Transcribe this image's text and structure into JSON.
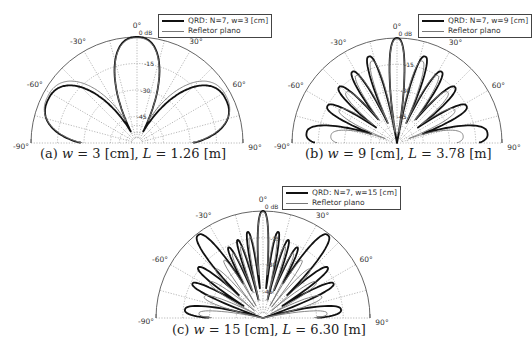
{
  "figure": {
    "background": "#ffffff",
    "line_colors": {
      "qrd": "#111111",
      "flat": "#7a7a7a",
      "grid": "#8a8a8a"
    }
  },
  "chart_data": [
    {
      "id": "a",
      "type": "polar",
      "caption": {
        "prefix": "(a) ",
        "var1": "w",
        "eq1": " = 3 [cm], ",
        "var2": "L",
        "eq2": " = 1.26 [m]"
      },
      "legend": [
        {
          "label": "QRD: N=7, w=3 [cm]",
          "style": "thick"
        },
        {
          "label": "Refletor plano",
          "style": "thin"
        }
      ],
      "angle_ticks": [
        "-90°",
        "-60°",
        "-30°",
        "0°",
        "30°",
        "60°",
        "90°"
      ],
      "angle_range": [
        -90,
        90
      ],
      "radial_ticks": [
        "0 dB",
        "-15",
        "-30",
        "-45"
      ],
      "radial_range_db": [
        -60,
        0
      ],
      "grid": true,
      "geometry": {
        "left": 31,
        "top": 0,
        "cx": 106,
        "cy": 143,
        "r": 106
      },
      "legend_pos": {
        "left": 158,
        "top": 14
      },
      "caption_pos": {
        "left": 40,
        "top": 146
      },
      "series": [
        {
          "name": "QRD: N=7, w=3 [cm]",
          "key": "qrd",
          "width": 1.8,
          "lobes": [
            {
              "center": 0,
              "peak": 0,
              "hw": 30
            },
            {
              "center": -64,
              "peak": -4,
              "hw": 38
            },
            {
              "center": 64,
              "peak": -4,
              "hw": 38
            }
          ]
        },
        {
          "name": "Refletor plano",
          "key": "flat",
          "width": 0.9,
          "lobes": [
            {
              "center": 0,
              "peak": -0.5,
              "hw": 30
            },
            {
              "center": -62,
              "peak": -3,
              "hw": 40
            },
            {
              "center": 62,
              "peak": -3,
              "hw": 40
            }
          ]
        }
      ]
    },
    {
      "id": "b",
      "type": "polar",
      "caption": {
        "prefix": "(b) ",
        "var1": "w",
        "eq1": " = 9 [cm], ",
        "var2": "L",
        "eq2": " = 3.78 [m]"
      },
      "legend": [
        {
          "label": "QRD: N=7, w=9 [cm]",
          "style": "thick"
        },
        {
          "label": "Refletor plano",
          "style": "thin"
        }
      ],
      "angle_ticks": [
        "-90°",
        "-60°",
        "-30°",
        "0°",
        "30°",
        "60°",
        "90°"
      ],
      "angle_range": [
        -90,
        90
      ],
      "radial_ticks": [
        "0 dB",
        "-15",
        "-30",
        "-45"
      ],
      "radial_range_db": [
        -60,
        0
      ],
      "grid": true,
      "geometry": {
        "left": 292,
        "top": 0,
        "cx": 105,
        "cy": 143,
        "r": 105
      },
      "legend_pos": {
        "left": 418,
        "top": 14
      },
      "caption_pos": {
        "left": 305,
        "top": 146
      },
      "series": [
        {
          "name": "QRD: N=7, w=9 [cm]",
          "key": "qrd",
          "width": 1.8,
          "lobes": [
            {
              "center": 0,
              "peak": 0,
              "hw": 10
            },
            {
              "center": -18,
              "peak": -8,
              "hw": 8
            },
            {
              "center": 18,
              "peak": -8,
              "hw": 8
            },
            {
              "center": -32,
              "peak": -12,
              "hw": 8
            },
            {
              "center": 32,
              "peak": -12,
              "hw": 8
            },
            {
              "center": -46,
              "peak": -14,
              "hw": 9
            },
            {
              "center": 46,
              "peak": -14,
              "hw": 9
            },
            {
              "center": -62,
              "peak": -15,
              "hw": 10
            },
            {
              "center": 62,
              "peak": -15,
              "hw": 10
            },
            {
              "center": -84,
              "peak": -8,
              "hw": 16
            },
            {
              "center": 84,
              "peak": -8,
              "hw": 16
            }
          ]
        },
        {
          "name": "Refletor plano",
          "key": "flat",
          "width": 0.9,
          "lobes": [
            {
              "center": 0,
              "peak": -0.5,
              "hw": 10
            },
            {
              "center": -17,
              "peak": -11,
              "hw": 8
            },
            {
              "center": 17,
              "peak": -11,
              "hw": 8
            },
            {
              "center": -31,
              "peak": -15,
              "hw": 8
            },
            {
              "center": 31,
              "peak": -15,
              "hw": 8
            },
            {
              "center": -45,
              "peak": -19,
              "hw": 9
            },
            {
              "center": 45,
              "peak": -19,
              "hw": 9
            },
            {
              "center": -60,
              "peak": -22,
              "hw": 10
            },
            {
              "center": 60,
              "peak": -22,
              "hw": 10
            },
            {
              "center": -84,
              "peak": -22,
              "hw": 16
            },
            {
              "center": 84,
              "peak": -22,
              "hw": 16
            }
          ]
        }
      ]
    },
    {
      "id": "c",
      "type": "polar",
      "caption": {
        "prefix": "(c) ",
        "var1": "w",
        "eq1": " = 15 [cm], ",
        "var2": "L",
        "eq2": " = 6.30 [m]"
      },
      "legend": [
        {
          "label": "QRD: N=7, w=15 [cm]",
          "style": "thick"
        },
        {
          "label": "Refletor plano",
          "style": "thin"
        }
      ],
      "angle_ticks": [
        "-90°",
        "-60°",
        "-30°",
        "0°",
        "30°",
        "60°",
        "90°"
      ],
      "angle_range": [
        -90,
        90
      ],
      "radial_ticks": [
        "0 dB",
        "-15",
        "-30",
        "-45"
      ],
      "radial_range_db": [
        -60,
        0
      ],
      "grid": true,
      "geometry": {
        "left": 156,
        "top": 176,
        "cx": 107,
        "cy": 142,
        "r": 107
      },
      "legend_pos": {
        "left": 282,
        "top": 186
      },
      "caption_pos": {
        "left": 172,
        "top": 322
      },
      "series": [
        {
          "name": "QRD: N=7, w=15 [cm]",
          "key": "qrd",
          "width": 1.8,
          "lobes": [
            {
              "center": 0,
              "peak": 0,
              "hw": 7
            },
            {
              "center": -10,
              "peak": -11,
              "hw": 4.5
            },
            {
              "center": 10,
              "peak": -11,
              "hw": 4.5
            },
            {
              "center": -18,
              "peak": -14,
              "hw": 4.5
            },
            {
              "center": 18,
              "peak": -14,
              "hw": 4.5
            },
            {
              "center": -26,
              "peak": -16,
              "hw": 5
            },
            {
              "center": 26,
              "peak": -16,
              "hw": 5
            },
            {
              "center": -38,
              "peak": -1,
              "hw": 10
            },
            {
              "center": 38,
              "peak": -1,
              "hw": 10
            },
            {
              "center": -52,
              "peak": -14,
              "hw": 7
            },
            {
              "center": 52,
              "peak": -14,
              "hw": 7
            },
            {
              "center": -64,
              "peak": -16,
              "hw": 7
            },
            {
              "center": 64,
              "peak": -16,
              "hw": 7
            },
            {
              "center": -84,
              "peak": -16,
              "hw": 10
            },
            {
              "center": 84,
              "peak": -16,
              "hw": 10
            }
          ]
        },
        {
          "name": "Refletor plano",
          "key": "flat",
          "width": 0.9,
          "lobes": [
            {
              "center": 0,
              "peak": -0.5,
              "hw": 7
            },
            {
              "center": -9,
              "peak": -14,
              "hw": 4.5
            },
            {
              "center": 9,
              "peak": -14,
              "hw": 4.5
            },
            {
              "center": -17,
              "peak": -18,
              "hw": 4.5
            },
            {
              "center": 17,
              "peak": -18,
              "hw": 4.5
            },
            {
              "center": -25,
              "peak": -20,
              "hw": 5
            },
            {
              "center": 25,
              "peak": -20,
              "hw": 5
            },
            {
              "center": -34,
              "peak": -21,
              "hw": 5
            },
            {
              "center": 34,
              "peak": -21,
              "hw": 5
            },
            {
              "center": -44,
              "peak": -22,
              "hw": 6
            },
            {
              "center": 44,
              "peak": -22,
              "hw": 6
            },
            {
              "center": -56,
              "peak": -24,
              "hw": 7
            },
            {
              "center": 56,
              "peak": -24,
              "hw": 7
            },
            {
              "center": -70,
              "peak": -25,
              "hw": 8
            },
            {
              "center": 70,
              "peak": -25,
              "hw": 8
            },
            {
              "center": -86,
              "peak": -24,
              "hw": 8
            },
            {
              "center": 86,
              "peak": -24,
              "hw": 8
            }
          ]
        }
      ]
    }
  ]
}
